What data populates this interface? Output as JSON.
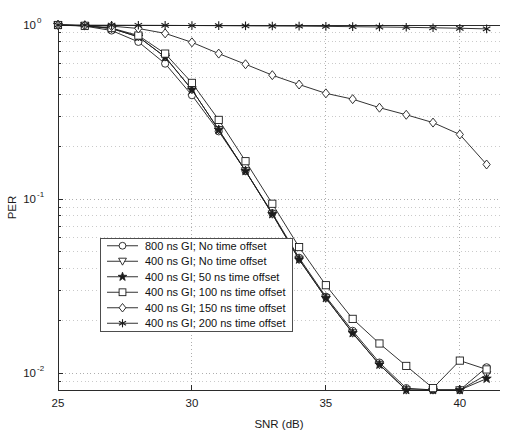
{
  "chart_data": {
    "type": "line",
    "title": "",
    "xlabel": "SNR (dB)",
    "ylabel": "PER",
    "xlim": [
      25,
      41.5
    ],
    "ylim": [
      0.008,
      1.0
    ],
    "yscale": "log",
    "xscale": "linear",
    "grid": true,
    "grid_style": "dotted",
    "legend_position": "lower-left-inside",
    "xticks": [
      25,
      30,
      35,
      40
    ],
    "xticklabels": [
      "25",
      "30",
      "35",
      "40"
    ],
    "yticks": [
      1,
      0.1,
      0.01
    ],
    "yticklabels": [
      "10^0",
      "10^-1",
      "10^-2"
    ],
    "x": [
      25,
      26,
      27,
      28,
      29,
      30,
      31,
      32,
      33,
      34,
      35,
      36,
      37,
      38,
      39,
      40,
      41
    ],
    "series": [
      {
        "name": "800 ns GI; No time offset",
        "marker": "circle",
        "marker_filled": false,
        "values": [
          1.0,
          0.985,
          0.93,
          0.8,
          0.6,
          0.395,
          0.245,
          0.145,
          0.083,
          0.046,
          0.0275,
          0.0175,
          0.0115,
          0.0082,
          0.0062,
          0.0048,
          0.0108
        ]
      },
      {
        "name": "400 ns GI; No time offset",
        "marker": "triangle-down",
        "marker_filled": false,
        "values": [
          1.0,
          0.99,
          0.955,
          0.855,
          0.655,
          0.425,
          0.25,
          0.145,
          0.082,
          0.045,
          0.027,
          0.017,
          0.0112,
          0.008,
          0.006,
          0.0046,
          0.0098
        ]
      },
      {
        "name": "400 ns GI; 50 ns time offset",
        "marker": "star",
        "marker_filled": true,
        "values": [
          1.0,
          0.99,
          0.955,
          0.855,
          0.655,
          0.425,
          0.25,
          0.145,
          0.082,
          0.045,
          0.027,
          0.017,
          0.0112,
          0.008,
          0.006,
          0.0046,
          0.0093
        ]
      },
      {
        "name": "400 ns GI; 100 ns time offset",
        "marker": "square",
        "marker_filled": false,
        "values": [
          1.0,
          0.99,
          0.96,
          0.87,
          0.685,
          0.465,
          0.285,
          0.165,
          0.094,
          0.053,
          0.032,
          0.0205,
          0.0148,
          0.011,
          0.0082,
          0.0118,
          0.0105
        ]
      },
      {
        "name": "400 ns GI; 150 ns time offset",
        "marker": "diamond",
        "marker_filled": false,
        "values": [
          1.0,
          0.995,
          0.985,
          0.955,
          0.895,
          0.795,
          0.685,
          0.595,
          0.515,
          0.455,
          0.405,
          0.375,
          0.335,
          0.305,
          0.275,
          0.235,
          0.158
        ]
      },
      {
        "name": "400 ns GI; 200 ns time offset",
        "marker": "asterisk",
        "marker_filled": true,
        "values": [
          1.0,
          0.998,
          0.997,
          0.996,
          0.995,
          0.993,
          0.991,
          0.989,
          0.987,
          0.985,
          0.982,
          0.978,
          0.974,
          0.97,
          0.964,
          0.958,
          0.95
        ]
      }
    ]
  },
  "axes": {
    "y_label": "PER",
    "x_label": "SNR (dB)",
    "y_tick_base": "10",
    "y_tick_exponents": [
      "0",
      "-1",
      "-2"
    ],
    "x_tick_labels": [
      "25",
      "30",
      "35",
      "40"
    ]
  },
  "legend": {
    "entries": [
      {
        "label": "800 ns GI; No time offset",
        "marker": "circle"
      },
      {
        "label": "400 ns GI; No time offset",
        "marker": "triangle-down"
      },
      {
        "label": "400 ns GI; 50 ns time offset",
        "marker": "star"
      },
      {
        "label": "400 ns GI; 100 ns time offset",
        "marker": "square"
      },
      {
        "label": "400 ns GI; 150 ns time offset",
        "marker": "diamond"
      },
      {
        "label": "400 ns GI; 200 ns time offset",
        "marker": "asterisk"
      }
    ]
  },
  "caption": {
    "text": ""
  },
  "colors": {
    "line": "#1c1c1c",
    "grid": "#9a9a9a",
    "axis": "#2b2b2b",
    "background": "#ffffff"
  }
}
